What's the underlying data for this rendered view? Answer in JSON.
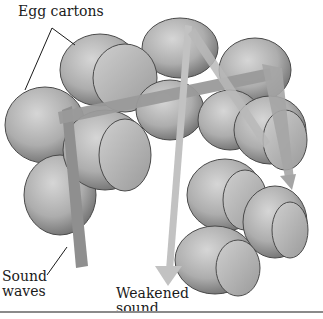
{
  "diagram": {
    "labels": {
      "egg_cartons": "Egg cartons",
      "sound_waves": "Sound\nwaves",
      "weakened_sound": "Weakened\nsound"
    },
    "colors": {
      "carton_light": "#c9c9c9",
      "carton_mid": "#a8a8a8",
      "carton_dark": "#5a5a5a",
      "incoming_arrow": "#8f8f8f",
      "reflected_arrow": "#bdbdbd",
      "text": "#1a1a1a",
      "rule": "#8a8a8a"
    }
  }
}
